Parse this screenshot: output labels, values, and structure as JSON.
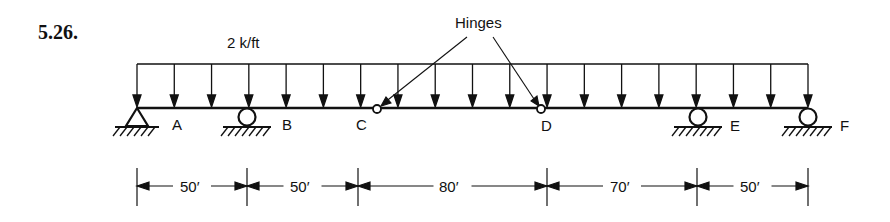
{
  "problem_number": "5.26.",
  "load": {
    "label": "2 k/ft",
    "type": "uniformly distributed",
    "x_start": 137,
    "x_end": 808,
    "arrow_count": 19
  },
  "annotation": {
    "label": "Hinges",
    "targets": [
      "C",
      "D"
    ]
  },
  "beam": {
    "y": 108,
    "x_start": 137,
    "x_end": 808
  },
  "points": [
    {
      "id": "A",
      "label": "A",
      "x": 137,
      "support": "pin",
      "label_x": 178
    },
    {
      "id": "B",
      "label": "B",
      "x": 247,
      "support": "roller",
      "label_x": 288
    },
    {
      "id": "C",
      "label": "C",
      "x": 377,
      "support": "hinge",
      "label_x": 361
    },
    {
      "id": "D",
      "label": "D",
      "x": 541,
      "support": "hinge",
      "label_x": 546
    },
    {
      "id": "E",
      "label": "E",
      "x": 698,
      "support": "roller",
      "label_x": 735
    },
    {
      "id": "F",
      "label": "F",
      "x": 808,
      "support": "roller",
      "label_x": 845
    }
  ],
  "dimensions": [
    {
      "label": "50′",
      "x1": 137,
      "x2": 247
    },
    {
      "label": "50′",
      "x1": 247,
      "x2": 358
    },
    {
      "label": "80′",
      "x1": 358,
      "x2": 547
    },
    {
      "label": "70′",
      "x1": 547,
      "x2": 697
    },
    {
      "label": "50′",
      "x1": 697,
      "x2": 808
    }
  ],
  "colors": {
    "ink": "#111111",
    "background": "#ffffff"
  }
}
